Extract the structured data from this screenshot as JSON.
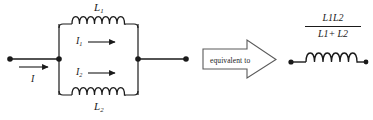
{
  "figure": {
    "background": "#ffffff",
    "ink": "#1a1a1a"
  },
  "left_circuit": {
    "name": "parallel-inductors",
    "input_current_label": "I",
    "branch_top": {
      "inductor_label_L": "L",
      "inductor_label_sub": "1",
      "current_label_I": "I",
      "current_label_sub": "1",
      "coil_turns": 4
    },
    "branch_bottom": {
      "inductor_label_L": "L",
      "inductor_label_sub": "2",
      "current_label_I": "I",
      "current_label_sub": "2",
      "coil_turns": 4
    }
  },
  "equivalence": {
    "arrow_text": "equivalent to"
  },
  "right_circuit": {
    "name": "equivalent-inductor",
    "coil_turns": 4,
    "value": {
      "numerator_L": "L",
      "numerator_sub_a": "1",
      "numerator_L2": "L",
      "numerator_sub_b": "2",
      "denominator_L": "L",
      "denominator_sub_a": "1",
      "denominator_plus": "+",
      "denominator_L2": "L",
      "denominator_sub_b": "2"
    }
  }
}
